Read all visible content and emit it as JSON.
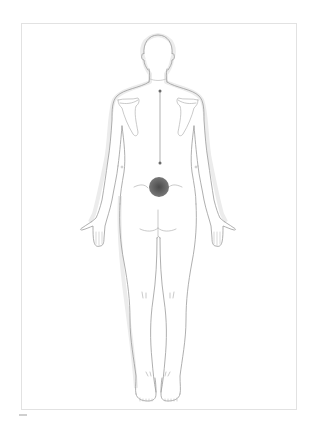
{
  "diagram": {
    "view": "posterior",
    "colors": {
      "outline": "#9a9a9a",
      "shadow": "#e6e6e6",
      "frame_border": "#e2e2e2",
      "spine_line": "#8c8c8c",
      "marker_fill": "#6a6a6a",
      "marker_center": "#4a4a4a"
    },
    "markers": [
      {
        "name": "upper-point",
        "x": 160,
        "y": 91,
        "r": 1.5,
        "type": "dot"
      },
      {
        "name": "mid-point",
        "x": 160,
        "y": 163,
        "r": 1.5,
        "type": "dot"
      },
      {
        "name": "pain-region",
        "x": 159,
        "y": 187,
        "r": 10,
        "type": "filled-circle"
      }
    ],
    "lines": [
      {
        "name": "spine-line",
        "from": [
          160,
          91
        ],
        "to": [
          160,
          163
        ]
      }
    ]
  },
  "caption": {
    "text": ""
  }
}
